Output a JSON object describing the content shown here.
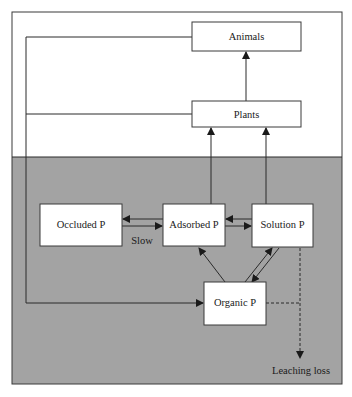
{
  "diagram": {
    "colors": {
      "soil_background": "#a3a3a3",
      "above_ground_background": "#ffffff",
      "box_fill": "#ffffff",
      "line": "#2a2a2a"
    },
    "regions": {
      "above_ground": "above-ground",
      "soil": "soil"
    },
    "nodes": {
      "animals": "Animals",
      "plants": "Plants",
      "occluded_p": "Occluded P",
      "adsorbed_p": "Adsorbed P",
      "solution_p": "Solution P",
      "organic_p": "Organic P"
    },
    "labels": {
      "slow": "Slow",
      "leaching_loss": "Leaching loss"
    },
    "edges": [
      {
        "from": "Plants",
        "to": "Animals",
        "style": "solid"
      },
      {
        "from": "Adsorbed P",
        "to": "Plants",
        "style": "solid"
      },
      {
        "from": "Solution P",
        "to": "Plants",
        "style": "solid"
      },
      {
        "from": "Adsorbed P",
        "to": "Occluded P",
        "style": "solid"
      },
      {
        "from": "Occluded P",
        "to": "Adsorbed P",
        "style": "solid",
        "label": "Slow"
      },
      {
        "from": "Solution P",
        "to": "Adsorbed P",
        "style": "solid"
      },
      {
        "from": "Adsorbed P",
        "to": "Solution P",
        "style": "solid"
      },
      {
        "from": "Organic P",
        "to": "Adsorbed P",
        "style": "solid"
      },
      {
        "from": "Organic P",
        "to": "Solution P",
        "style": "solid"
      },
      {
        "from": "Solution P",
        "to": "Organic P",
        "style": "solid"
      },
      {
        "from": "Animals",
        "to": "Organic P",
        "style": "solid"
      },
      {
        "from": "Plants",
        "to": "Organic P",
        "style": "solid"
      },
      {
        "from": "Solution P",
        "to": "Leaching loss",
        "style": "dashed"
      },
      {
        "from": "Organic P",
        "to": "Leaching loss",
        "style": "dashed"
      }
    ]
  }
}
